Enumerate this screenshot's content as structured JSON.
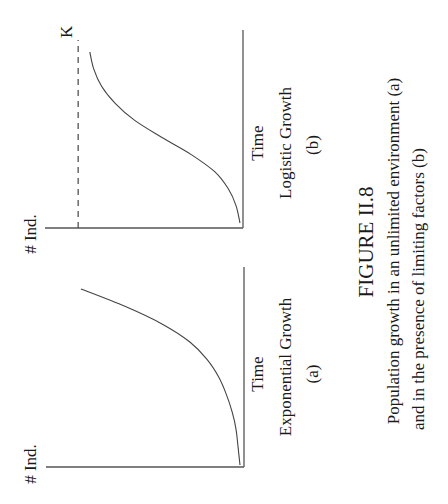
{
  "chart_data": [
    {
      "type": "line",
      "id": "a",
      "title": "Exponential Growth",
      "panel_label": "(a)",
      "xlabel": "Time",
      "ylabel": "# Ind.",
      "xlim": [
        0,
        1
      ],
      "ylim": [
        0,
        1
      ],
      "grid": false,
      "series": [
        {
          "name": "exponential",
          "x": [
            0.0,
            0.1,
            0.2,
            0.3,
            0.4,
            0.5,
            0.6,
            0.7,
            0.8,
            0.9,
            1.0
          ],
          "y": [
            0.0,
            0.01,
            0.02,
            0.04,
            0.07,
            0.11,
            0.17,
            0.26,
            0.4,
            0.59,
            0.82
          ]
        }
      ]
    },
    {
      "type": "line",
      "id": "b",
      "title": "Logistic Growth",
      "panel_label": "(b)",
      "xlabel": "Time",
      "ylabel": "# Ind.",
      "xlim": [
        0,
        1
      ],
      "ylim": [
        0,
        1
      ],
      "grid": false,
      "annotations": [
        {
          "text": "K",
          "type": "dashed-horizontal-line",
          "y": 0.83
        }
      ],
      "series": [
        {
          "name": "logistic",
          "x": [
            0.0,
            0.1,
            0.2,
            0.3,
            0.4,
            0.5,
            0.6,
            0.7,
            0.8,
            0.9,
            1.0
          ],
          "y": [
            0.0,
            0.02,
            0.06,
            0.13,
            0.25,
            0.4,
            0.54,
            0.64,
            0.71,
            0.75,
            0.77
          ]
        }
      ]
    }
  ],
  "figure": {
    "number": "FIGURE II.8",
    "caption_lines": [
      "Population growth in an unlimited environment (a)",
      "and in the presence of limiting factors (b)"
    ]
  }
}
